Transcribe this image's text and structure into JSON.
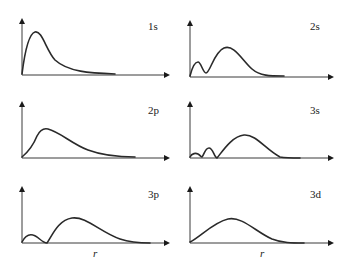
{
  "chart_data": [
    {
      "type": "line",
      "title": "1s",
      "xlabel": "",
      "ylabel": "",
      "grid": false,
      "series": [
        {
          "name": "1s",
          "x": [
            0,
            1,
            2,
            3,
            4,
            5,
            6,
            7,
            8,
            9,
            10
          ],
          "values": [
            0,
            0.85,
            1.0,
            0.75,
            0.45,
            0.25,
            0.12,
            0.06,
            0.03,
            0.01,
            0
          ]
        }
      ],
      "panel": {
        "ox": 22,
        "oy": 75,
        "ytop": 18,
        "xend": 170,
        "label_x": 148,
        "label_y": 30
      },
      "path": "M22,74 C24,58 28,34 35,32 C42,30 46,50 55,60 C68,72 90,73 115,74"
    },
    {
      "type": "line",
      "title": "2s",
      "xlabel": "",
      "ylabel": "",
      "grid": false,
      "series": [
        {
          "name": "2s",
          "x": [
            0,
            1,
            2,
            3,
            4,
            5,
            6,
            7,
            8,
            9,
            10
          ],
          "values": [
            0,
            0.45,
            0,
            0.55,
            0.95,
            1.0,
            0.7,
            0.35,
            0.12,
            0.03,
            0
          ]
        }
      ],
      "panel": {
        "ox": 190,
        "oy": 77,
        "ytop": 20,
        "xend": 334,
        "label_x": 310,
        "label_y": 30
      },
      "path": "M190,76 C192,68 195,62 198,62 C201,62 203,73 206,73 C210,73 214,52 224,48 C234,44 242,60 252,69 C260,76 270,76 284,76"
    },
    {
      "type": "line",
      "title": "2p",
      "xlabel": "",
      "ylabel": "",
      "grid": false,
      "series": [
        {
          "name": "2p",
          "x": [
            0,
            1,
            2,
            3,
            4,
            5,
            6,
            7,
            8,
            9,
            10
          ],
          "values": [
            0,
            0.55,
            1.0,
            0.9,
            0.7,
            0.48,
            0.3,
            0.16,
            0.07,
            0.02,
            0
          ]
        }
      ],
      "panel": {
        "ox": 22,
        "oy": 158,
        "ytop": 101,
        "xend": 170,
        "label_x": 148,
        "label_y": 114
      },
      "path": "M22,157 C28,152 33,146 37,136 C40,130 44,128 48,129 C60,132 72,144 88,150 C104,156 118,157 135,157"
    },
    {
      "type": "line",
      "title": "3s",
      "xlabel": "",
      "ylabel": "",
      "grid": false,
      "series": [
        {
          "name": "3s",
          "x": [
            0,
            1,
            2,
            3,
            4,
            5,
            6,
            7,
            8,
            9,
            10
          ],
          "values": [
            0.15,
            0,
            0.4,
            0,
            0.5,
            0.9,
            1.0,
            0.7,
            0.3,
            0.06,
            0
          ]
        }
      ],
      "panel": {
        "ox": 190,
        "oy": 158,
        "ytop": 101,
        "xend": 334,
        "label_x": 310,
        "label_y": 114
      },
      "path": "M190,157 C192,153 196,153 198,154 C200,155 201,157 202,157 C204,155 205,148 209,148 C213,148 214,157 217,158 C222,152 232,136 244,135 C256,134 266,150 280,157 C286,158 292,158 300,158"
    },
    {
      "type": "line",
      "title": "3p",
      "xlabel": "r",
      "ylabel": "",
      "grid": false,
      "series": [
        {
          "name": "3p",
          "x": [
            0,
            1,
            2,
            3,
            4,
            5,
            6,
            7,
            8,
            9,
            10
          ],
          "values": [
            0,
            0.3,
            0,
            0.6,
            1.0,
            0.9,
            0.65,
            0.4,
            0.18,
            0.05,
            0
          ]
        }
      ],
      "panel": {
        "ox": 22,
        "oy": 243,
        "ytop": 186,
        "xend": 170,
        "label_x": 148,
        "label_y": 198,
        "r_x": 93,
        "r_y": 257
      },
      "path": "M22,242 C25,236 29,234 33,235 C38,236 42,243 47,243 C52,236 58,220 72,218 C86,216 100,232 120,239 C132,243 142,243 150,243"
    },
    {
      "type": "line",
      "title": "3d",
      "xlabel": "r",
      "ylabel": "",
      "grid": false,
      "series": [
        {
          "name": "3d",
          "x": [
            0,
            1,
            2,
            3,
            4,
            5,
            6,
            7,
            8,
            9,
            10
          ],
          "values": [
            0,
            0.3,
            0.65,
            0.95,
            1.0,
            0.8,
            0.55,
            0.3,
            0.1,
            0.02,
            0
          ]
        }
      ],
      "panel": {
        "ox": 190,
        "oy": 243,
        "ytop": 186,
        "xend": 334,
        "label_x": 310,
        "label_y": 198,
        "r_x": 260,
        "r_y": 257
      },
      "path": "M190,242 C200,237 214,222 228,219 C242,216 256,232 272,239 C282,243 292,243 304,243"
    }
  ]
}
